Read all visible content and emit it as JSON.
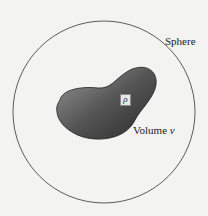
{
  "diagram": {
    "sphere": {
      "label": "Sphere",
      "cx": 104,
      "cy": 112,
      "r": 91,
      "stroke": "#333333"
    },
    "volume": {
      "label_prefix": "Volume ",
      "label_var": "v",
      "fill_light": "#8a8a8a",
      "fill_dark": "#2e2e2e"
    },
    "density": {
      "symbol": "ρ"
    }
  }
}
